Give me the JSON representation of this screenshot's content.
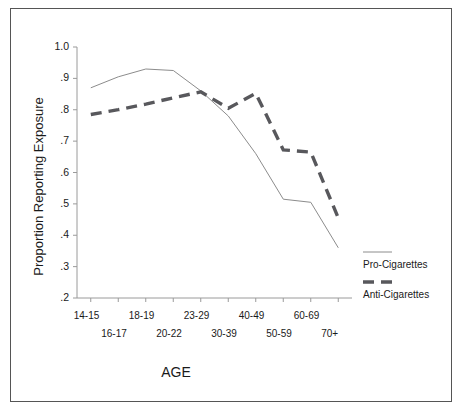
{
  "chart_data": {
    "type": "line",
    "title": "",
    "xlabel": "AGE",
    "ylabel": "Proportion Reporting Exposure",
    "categories": [
      "14-15",
      "16-17",
      "18-19",
      "20-22",
      "23-29",
      "30-39",
      "40-49",
      "50-59",
      "60-69",
      "70+"
    ],
    "ylim": [
      0.2,
      1.0
    ],
    "yticks": [
      "1.0",
      ".9",
      ".8",
      ".7",
      ".6",
      ".5",
      ".4",
      ".3",
      ".2"
    ],
    "ytick_values": [
      1.0,
      0.9,
      0.8,
      0.7,
      0.6,
      0.5,
      0.4,
      0.3,
      0.2
    ],
    "grid": false,
    "legend_position": "right",
    "series": [
      {
        "name": "Pro-Cigarettes",
        "style": "solid-thin",
        "color": "#8c8c8c",
        "values": [
          0.87,
          0.905,
          0.93,
          0.925,
          0.86,
          0.78,
          0.66,
          0.515,
          0.505,
          0.36
        ]
      },
      {
        "name": "Anti-Cigarettes",
        "style": "dashed-thick",
        "color": "#58585c",
        "values": [
          0.785,
          0.8,
          0.818,
          0.838,
          0.857,
          0.805,
          0.852,
          0.672,
          0.665,
          0.455
        ]
      }
    ]
  },
  "axis": {
    "x_title": "AGE",
    "y_title": "Proportion Reporting Exposure"
  },
  "legend": {
    "items": [
      {
        "label": "Pro-Cigarettes",
        "style": "solid-thin"
      },
      {
        "label": "Anti-Cigarettes",
        "style": "dashed-thick"
      }
    ]
  }
}
